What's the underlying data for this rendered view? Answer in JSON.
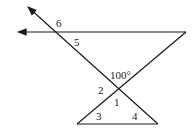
{
  "diagram": {
    "type": "geometry-angles",
    "labels": {
      "angle6": "6",
      "angle5": "5",
      "angle_given": "100°",
      "angle2": "2",
      "angle1": "1",
      "angle3": "3",
      "angle4": "4"
    },
    "stroke_color": "#1a1a1a",
    "background": "#ffffff"
  }
}
